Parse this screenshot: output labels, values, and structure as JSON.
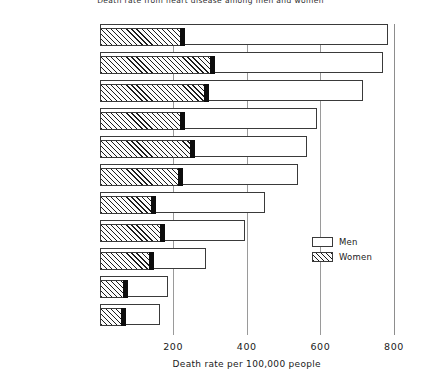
{
  "chart_data": {
    "type": "bar",
    "orientation": "horizontal",
    "title": "Death rate from heart disease among men and women",
    "xlabel": "Death rate per 100,000 people",
    "ylabel": "",
    "xlim": [
      0,
      800
    ],
    "xticks": [
      200,
      400,
      600,
      800
    ],
    "xtick_labels": [
      "200",
      "400",
      "600",
      "800"
    ],
    "grid": true,
    "legend_position": "right-middle",
    "categories": [
      "Finland",
      "Northern Ireland",
      "Scotland",
      "England and Wales",
      "United States",
      "Canada",
      "Norway",
      "Austria",
      "Italy",
      "Spain",
      "Japan"
    ],
    "series": [
      {
        "name": "Men",
        "values": [
          785,
          770,
          715,
          590,
          565,
          540,
          450,
          395,
          290,
          185,
          165
        ]
      },
      {
        "name": "Women",
        "values": [
          225,
          305,
          290,
          225,
          250,
          220,
          145,
          170,
          140,
          70,
          65
        ]
      }
    ]
  },
  "axis": {
    "x_label": "Death rate per 100,000 people",
    "ticks": [
      "200",
      "400",
      "600",
      "800"
    ]
  },
  "legend": {
    "items": [
      {
        "label": "Men",
        "style": "open"
      },
      {
        "label": "Women",
        "style": "hatched"
      }
    ]
  }
}
